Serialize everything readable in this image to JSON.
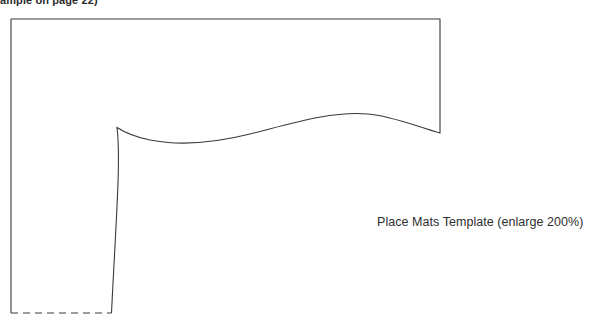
{
  "page": {
    "width": 601,
    "height": 323,
    "background_color": "#ffffff"
  },
  "header_note": {
    "text": "ample on page 22)",
    "note": "clipped text at top edge of page",
    "color": "#2b2b2b"
  },
  "caption": {
    "text": "Place Mats Template (enlarge 200%)",
    "color": "#2e2e2e"
  },
  "diagram": {
    "name": "place-mats-template-outline",
    "stroke_color": "#3a3a3a",
    "stroke_width": 1.1,
    "fill": "none",
    "solid_outline_path": "M 11 19 L 440 19 L 440 133 C 415 126 392 116 368 114 C 330 111 290 124 250 134 C 210 144 175 145 150 140 C 135 137 124 132 117 127.5 C 121 160 116 220 111.5 313",
    "left_edge_path": "M 11 19 L 11 313",
    "dashed_edge": {
      "path": "M 11 313 L 111.5 313",
      "dash_pattern": "7 5",
      "stroke_color": "#3a3a3a"
    }
  }
}
